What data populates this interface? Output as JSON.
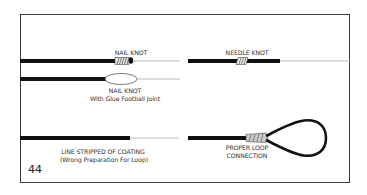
{
  "diagram": {
    "colors": {
      "frame": "#3a3a3a",
      "fly_line": "#111111",
      "leader": "#bbbbbb",
      "knot_wrap": "#9a9a9a"
    },
    "panels": [
      {
        "id": "nail-knot",
        "label": "NAIL KNOT"
      },
      {
        "id": "nail-knot-glue",
        "label": "NAIL KNOT",
        "sublabel": "With Glue Football Joint"
      },
      {
        "id": "needle-knot",
        "label": "NEEDLE KNOT"
      },
      {
        "id": "stripped-line",
        "label": "LINE STRIPPED OF COATING",
        "sublabel": "(Wrong Preparation For Loop)"
      },
      {
        "id": "proper-loop",
        "label": "PROPER LOOP",
        "sublabel": "CONNECTION"
      }
    ]
  },
  "page": {
    "number": "44"
  }
}
